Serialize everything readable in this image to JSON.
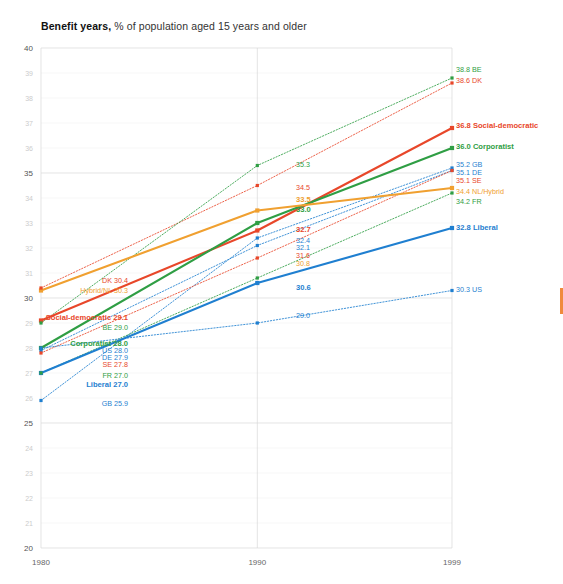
{
  "title": {
    "bold": "Benefit years,",
    "rest": " % of population aged 15 years and older"
  },
  "chart_data": {
    "type": "line",
    "title": "Benefit years, % of population aged 15 years and older",
    "xlabel": "",
    "ylabel": "",
    "x": [
      1980,
      1990,
      1999
    ],
    "xticks": [
      "1980",
      "1990",
      "1999"
    ],
    "ylim": [
      20,
      40
    ],
    "yticks_major": [
      "20",
      "25",
      "30",
      "35",
      "40"
    ],
    "yticks_minor": [
      "21",
      "22",
      "23",
      "24",
      "26",
      "27",
      "28",
      "29",
      "31",
      "32",
      "33",
      "34",
      "36",
      "37",
      "38",
      "39"
    ],
    "grid": true,
    "legend": "inline-end-labels",
    "series": [
      {
        "name": "Social-democratic",
        "kind": "regime",
        "style": "solid",
        "color": "#e8472a",
        "values": [
          29.1,
          32.7,
          36.8
        ],
        "start_label": "Social-democratic 29.1",
        "mid_label": "32.7",
        "end_label": "36.8 Social-democratic"
      },
      {
        "name": "Corporatist",
        "kind": "regime",
        "style": "solid",
        "color": "#2f9e44",
        "values": [
          28.0,
          33.0,
          36.0
        ],
        "start_label": "Corporatist 28.0",
        "mid_label": "33.0",
        "end_label": "36.0 Corporatist"
      },
      {
        "name": "Hybrid/NL",
        "kind": "regime",
        "style": "solid",
        "color": "#f0a030",
        "values": [
          30.3,
          33.5,
          34.4
        ],
        "start_label": "Hybrid/NL 30.3",
        "mid_label": "33.5",
        "end_label": "34.4 NL/Hybrid"
      },
      {
        "name": "Liberal",
        "kind": "regime",
        "style": "solid",
        "color": "#1f7fd0",
        "values": [
          27.0,
          30.6,
          32.8
        ],
        "start_label": "Liberal 27.0",
        "mid_label": "30.6",
        "end_label": "32.8 Liberal"
      },
      {
        "name": "DK",
        "kind": "country",
        "style": "dotted",
        "color": "#e8472a",
        "values": [
          30.4,
          34.5,
          38.6
        ],
        "start_label": "DK 30.4",
        "mid_label": "34.5",
        "end_label": "38.6 DK"
      },
      {
        "name": "BE",
        "kind": "country",
        "style": "dotted",
        "color": "#2f9e44",
        "values": [
          29.0,
          35.3,
          38.8
        ],
        "start_label": "BE 29.0",
        "mid_label": "35.3",
        "end_label": "38.8 BE"
      },
      {
        "name": "GB",
        "kind": "country",
        "style": "dotted",
        "color": "#1f7fd0",
        "values": [
          25.9,
          32.4,
          35.2
        ],
        "start_label": "GB 25.9",
        "mid_label": "32.4",
        "end_label": "35.2 GB"
      },
      {
        "name": "DE",
        "kind": "country",
        "style": "dotted",
        "color": "#1f7fd0",
        "values": [
          27.9,
          32.1,
          35.1
        ],
        "start_label": "DE 27.9",
        "mid_label": "32.1",
        "end_label": "35.1 DE"
      },
      {
        "name": "SE",
        "kind": "country",
        "style": "dotted",
        "color": "#e8472a",
        "values": [
          27.8,
          31.6,
          35.1
        ],
        "start_label": "SE 27.8",
        "mid_label": "31.6",
        "end_label": "35.1 SE"
      },
      {
        "name": "FR",
        "kind": "country",
        "style": "dotted",
        "color": "#2f9e44",
        "values": [
          27.0,
          30.8,
          34.2
        ],
        "start_label": "FR 27.0",
        "mid_label": "30.8",
        "end_label": "34.2 FR"
      },
      {
        "name": "US",
        "kind": "country",
        "style": "dotted",
        "color": "#1f7fd0",
        "values": [
          28.0,
          29.0,
          30.3
        ],
        "start_label": "US 28.0",
        "mid_label": "29.0",
        "end_label": "30.3 US"
      }
    ]
  },
  "labels": {
    "left": [
      {
        "text": "DK 30.4",
        "color": "#e8472a",
        "x": 128,
        "y": 283,
        "bold": false
      },
      {
        "text": "Hybrid/NL 30.3",
        "color": "#f0a030",
        "x": 128,
        "y": 293,
        "bold": false
      },
      {
        "text": "Social-democratic 29.1",
        "color": "#e8472a",
        "x": 128,
        "y": 320,
        "bold": true
      },
      {
        "text": "BE 29.0",
        "color": "#2f9e44",
        "x": 128,
        "y": 330,
        "bold": false
      },
      {
        "text": "Corporatist 28.0",
        "color": "#2f9e44",
        "x": 128,
        "y": 346,
        "bold": true
      },
      {
        "text": "US 28.0",
        "color": "#1f7fd0",
        "x": 128,
        "y": 353,
        "bold": false
      },
      {
        "text": "DE 27.9",
        "color": "#1f7fd0",
        "x": 128,
        "y": 360,
        "bold": false
      },
      {
        "text": "SE 27.8",
        "color": "#e8472a",
        "x": 128,
        "y": 367,
        "bold": false
      },
      {
        "text": "FR 27.0",
        "color": "#2f9e44",
        "x": 128,
        "y": 378,
        "bold": false
      },
      {
        "text": "Liberal 27.0",
        "color": "#1f7fd0",
        "x": 128,
        "y": 387,
        "bold": true
      },
      {
        "text": "GB 25.9",
        "color": "#1f7fd0",
        "x": 128,
        "y": 406,
        "bold": false
      }
    ],
    "mid": [
      {
        "text": "35.3",
        "color": "#2f9e44",
        "x": 296,
        "y": 167,
        "bold": false
      },
      {
        "text": "34.5",
        "color": "#e8472a",
        "x": 296,
        "y": 190,
        "bold": false
      },
      {
        "text": "33.5",
        "color": "#f0a030",
        "x": 296,
        "y": 202,
        "bold": true
      },
      {
        "text": "33.0",
        "color": "#2f9e44",
        "x": 296,
        "y": 212,
        "bold": true
      },
      {
        "text": "32.7",
        "color": "#e8472a",
        "x": 296,
        "y": 232,
        "bold": true
      },
      {
        "text": "32.4",
        "color": "#1f7fd0",
        "x": 296,
        "y": 243,
        "bold": false
      },
      {
        "text": "32.1",
        "color": "#1f7fd0",
        "x": 296,
        "y": 250,
        "bold": false
      },
      {
        "text": "31.6",
        "color": "#e8472a",
        "x": 296,
        "y": 258,
        "bold": false
      },
      {
        "text": "30.8",
        "color": "#f0a030",
        "x": 296,
        "y": 266,
        "bold": false
      },
      {
        "text": "30.6",
        "color": "#1f7fd0",
        "x": 296,
        "y": 290,
        "bold": true
      },
      {
        "text": "29.0",
        "color": "#1f7fd0",
        "x": 296,
        "y": 318,
        "bold": false
      }
    ],
    "right": [
      {
        "text": "38.8 BE",
        "color": "#2f9e44",
        "x": 456,
        "y": 72,
        "bold": false
      },
      {
        "text": "38.6 DK",
        "color": "#e8472a",
        "x": 456,
        "y": 83,
        "bold": false
      },
      {
        "text": "36.8 Social-democratic",
        "color": "#e8472a",
        "x": 456,
        "y": 128,
        "bold": true
      },
      {
        "text": "36.0 Corporatist",
        "color": "#2f9e44",
        "x": 456,
        "y": 149,
        "bold": true
      },
      {
        "text": "35.2 GB",
        "color": "#1f7fd0",
        "x": 456,
        "y": 167,
        "bold": false
      },
      {
        "text": "35.1 DE",
        "color": "#1f7fd0",
        "x": 456,
        "y": 175,
        "bold": false
      },
      {
        "text": "35.1 SE",
        "color": "#e8472a",
        "x": 456,
        "y": 183,
        "bold": false
      },
      {
        "text": "34.4 NL/Hybrid",
        "color": "#f0a030",
        "x": 456,
        "y": 194,
        "bold": false
      },
      {
        "text": "34.2 FR",
        "color": "#2f9e44",
        "x": 456,
        "y": 204,
        "bold": false
      },
      {
        "text": "32.8 Liberal",
        "color": "#1f7fd0",
        "x": 456,
        "y": 230,
        "bold": true
      },
      {
        "text": "30.3 US",
        "color": "#1f7fd0",
        "x": 456,
        "y": 292,
        "bold": false
      }
    ]
  },
  "colors": {
    "social_democratic": "#e8472a",
    "corporatist": "#2f9e44",
    "hybrid": "#f0a030",
    "liberal": "#1f7fd0",
    "grid_major": "#d8d8d8",
    "grid_minor": "#efefef"
  }
}
